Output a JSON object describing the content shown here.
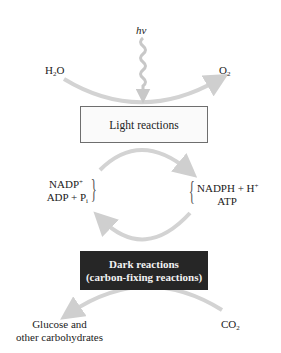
{
  "diagram": {
    "type": "photosynthesis-overview",
    "light_input": "hv",
    "top_left_input": {
      "base": "H",
      "sub": "2",
      "tail": "O"
    },
    "top_right_output": {
      "base": "O",
      "sub": "2"
    },
    "light_box": {
      "label": "Light reactions"
    },
    "cycle_left": {
      "line1": {
        "base": "NADP",
        "sup": "+"
      },
      "line2": {
        "base": "ADP + P",
        "sub": "i"
      }
    },
    "cycle_right": {
      "line1": {
        "base": "NADPH + H",
        "sup": "+"
      },
      "line2": {
        "base": "ATP"
      }
    },
    "dark_box": {
      "line1": "Dark reactions",
      "line2": "(carbon-fixing reactions)"
    },
    "bottom_left_output": {
      "line1": "Glucose and",
      "line2": "other carbohydrates"
    },
    "bottom_right_input": {
      "base": "CO",
      "sub": "2"
    },
    "colors": {
      "arrow": "#cfcfcf",
      "light_box_border": "#6e6e6e",
      "light_box_fill": "#fafafa",
      "dark_box_fill": "#262626",
      "dark_box_text": "#f2f2f2"
    }
  }
}
